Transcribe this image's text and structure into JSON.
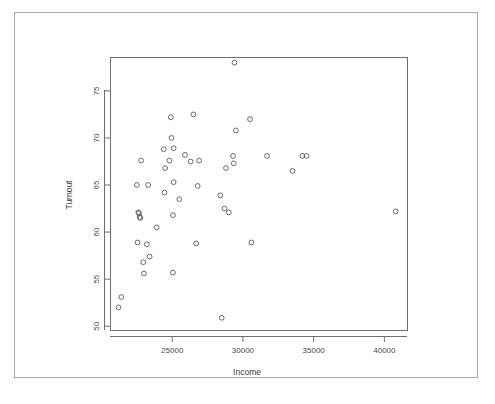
{
  "chart_data": {
    "type": "scatter",
    "title": "",
    "xlabel": "Income",
    "ylabel": "Turnout",
    "xlim": [
      20600,
      41600
    ],
    "ylim": [
      49.6,
      78.6
    ],
    "grid": false,
    "legend": null,
    "xticks": [
      25000,
      30000,
      35000,
      40000
    ],
    "yticks": [
      50,
      55,
      60,
      65,
      70,
      75
    ],
    "xtick_labels": [
      "25000",
      "30000",
      "35000",
      "40000"
    ],
    "ytick_labels": [
      "50",
      "55",
      "60",
      "65",
      "70",
      "75"
    ],
    "marker": "open-circle",
    "marker_color": "#5a5a5a",
    "n_points": 53,
    "x": [
      21200,
      21400,
      22500,
      22600,
      22600,
      22700,
      22700,
      22750,
      22800,
      23000,
      23100,
      23200,
      23300,
      23400,
      23700,
      24000,
      24300,
      24400,
      24500,
      24600,
      24700,
      24800,
      24900,
      25000,
      25050,
      25100,
      25200,
      25400,
      25600,
      25800,
      26000,
      26200,
      26400,
      26600,
      26800,
      27000,
      27400,
      28400,
      28600,
      28700,
      28800,
      29100,
      29200,
      29300,
      29400,
      29500,
      30400,
      30600,
      31700,
      33500,
      34200,
      34500,
      40800
    ],
    "y": [
      52.0,
      53.1,
      65.0,
      62.1,
      62.0,
      61.6,
      61.5,
      67.6,
      58.9,
      55.6,
      56.8,
      58.7,
      65.0,
      57.4,
      60.5,
      68.8,
      66.8,
      64.2,
      67.6,
      72.2,
      70.0,
      68.9,
      65.3,
      61.8,
      55.7,
      67.6,
      63.5,
      68.2,
      67.5,
      72.5,
      64.9,
      67.6,
      58.8,
      63.9,
      62.5,
      62.1,
      66.8,
      50.9,
      78.0,
      68.1,
      67.3,
      70.8,
      72.0,
      58.9,
      68.1,
      66.5,
      68.1,
      68.2,
      62.2,
      68.1,
      67.5,
      65.0,
      62.2
    ],
    "points": [
      {
        "x": 21200,
        "y": 52.0
      },
      {
        "x": 21400,
        "y": 53.1
      },
      {
        "x": 22500,
        "y": 65.0
      },
      {
        "x": 22600,
        "y": 62.1
      },
      {
        "x": 22650,
        "y": 62.0
      },
      {
        "x": 22700,
        "y": 61.6
      },
      {
        "x": 22750,
        "y": 61.5
      },
      {
        "x": 22800,
        "y": 67.6
      },
      {
        "x": 22550,
        "y": 58.9
      },
      {
        "x": 23000,
        "y": 55.6
      },
      {
        "x": 22950,
        "y": 56.8
      },
      {
        "x": 23200,
        "y": 58.7
      },
      {
        "x": 23300,
        "y": 65.0
      },
      {
        "x": 23400,
        "y": 57.4
      },
      {
        "x": 23900,
        "y": 60.5
      },
      {
        "x": 24400,
        "y": 68.8
      },
      {
        "x": 24500,
        "y": 66.8
      },
      {
        "x": 24450,
        "y": 64.2
      },
      {
        "x": 24800,
        "y": 67.6
      },
      {
        "x": 24900,
        "y": 72.2
      },
      {
        "x": 24950,
        "y": 70.0
      },
      {
        "x": 25100,
        "y": 68.9
      },
      {
        "x": 25100,
        "y": 65.3
      },
      {
        "x": 25050,
        "y": 61.8
      },
      {
        "x": 25050,
        "y": 55.7
      },
      {
        "x": 25500,
        "y": 63.5
      },
      {
        "x": 25900,
        "y": 68.2
      },
      {
        "x": 26300,
        "y": 67.5
      },
      {
        "x": 26500,
        "y": 72.5
      },
      {
        "x": 26800,
        "y": 64.9
      },
      {
        "x": 26900,
        "y": 67.6
      },
      {
        "x": 26700,
        "y": 58.8
      },
      {
        "x": 28400,
        "y": 63.9
      },
      {
        "x": 28700,
        "y": 62.5
      },
      {
        "x": 29000,
        "y": 62.1
      },
      {
        "x": 28800,
        "y": 66.8
      },
      {
        "x": 28500,
        "y": 50.9
      },
      {
        "x": 29400,
        "y": 78.0
      },
      {
        "x": 29300,
        "y": 68.1
      },
      {
        "x": 29350,
        "y": 67.3
      },
      {
        "x": 29500,
        "y": 70.8
      },
      {
        "x": 30500,
        "y": 72.0
      },
      {
        "x": 30600,
        "y": 58.9
      },
      {
        "x": 31700,
        "y": 68.1
      },
      {
        "x": 33500,
        "y": 66.5
      },
      {
        "x": 34200,
        "y": 68.1
      },
      {
        "x": 34500,
        "y": 68.1
      },
      {
        "x": 40800,
        "y": 62.2
      }
    ]
  },
  "figure": {
    "xlabel": "Income",
    "ylabel": "Turnout",
    "xtick_labels": [
      "25000",
      "30000",
      "35000",
      "40000"
    ],
    "ytick_labels": [
      "50",
      "55",
      "60",
      "65",
      "70",
      "75"
    ]
  }
}
